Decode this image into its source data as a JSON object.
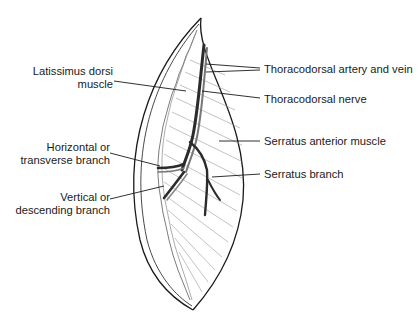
{
  "figure": {
    "type": "anatomical illustration",
    "labels": {
      "latissimus": [
        "Latissimus dorsi",
        "muscle"
      ],
      "artery_vein": "Thoracodorsal artery and vein",
      "nerve": "Thoracodorsal nerve",
      "serratus_muscle": "Serratus anterior muscle",
      "horizontal_branch": [
        "Horizontal or",
        "transverse branch"
      ],
      "serratus_branch": "Serratus branch",
      "vertical_branch": [
        "Vertical or",
        "descending branch"
      ]
    },
    "colors": {
      "ink": "#1a1a1a",
      "vessel_dark": "#2b2b2b",
      "vessel_mid": "#777777",
      "fiber": "#9a9a9a",
      "background": "#ffffff"
    }
  }
}
